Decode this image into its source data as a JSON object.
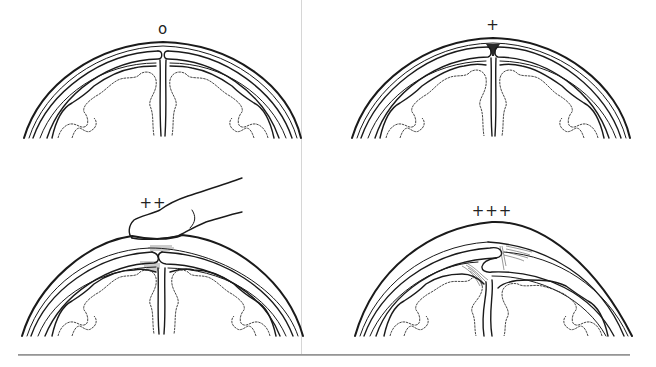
{
  "figure": {
    "panels": [
      {
        "id": "top-left",
        "grade_label": "o",
        "severity": 0,
        "has_finger": false
      },
      {
        "id": "top-right",
        "grade_label": "+",
        "severity": 1,
        "has_finger": false
      },
      {
        "id": "bottom-left",
        "grade_label": "++",
        "severity": 2,
        "has_finger": true
      },
      {
        "id": "bottom-right",
        "grade_label": "+++",
        "severity": 3,
        "has_finger": false
      }
    ],
    "colors": {
      "line": "#1a1a1a",
      "divider": "#d6d6d6",
      "background": "#ffffff"
    }
  }
}
